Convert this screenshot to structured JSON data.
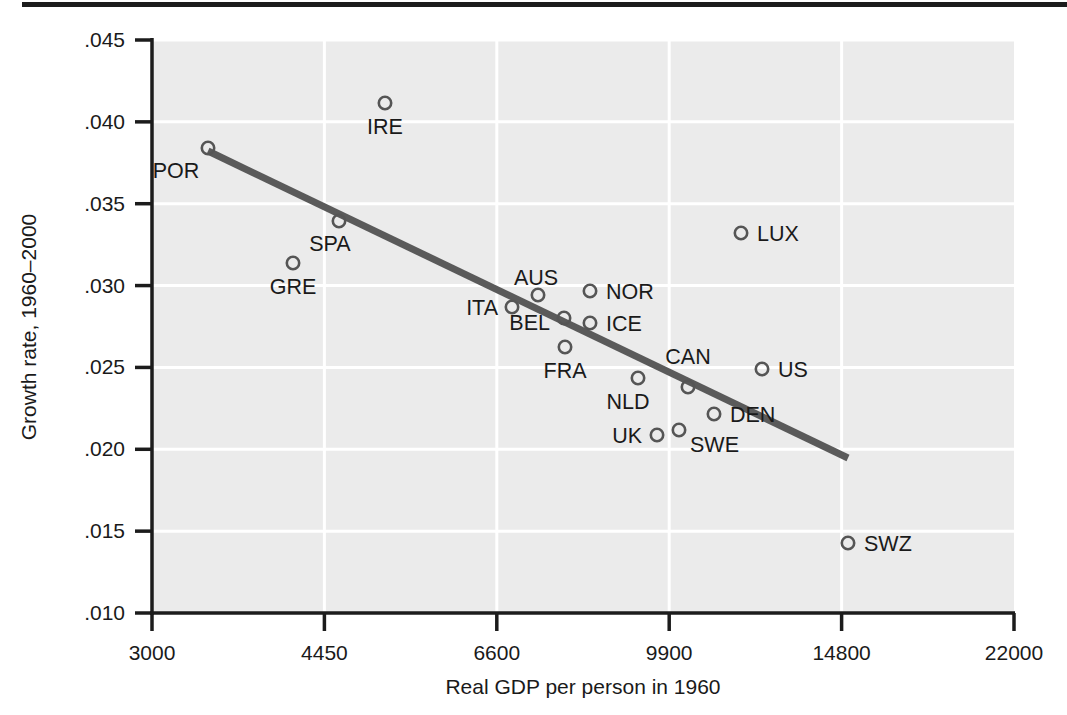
{
  "figure": {
    "background_color": "#ffffff",
    "plot_background_color": "#ebebeb",
    "gridline_color": "#ffffff",
    "axis_color": "#1c1c1c",
    "marker_color": "#555555",
    "trendline_color": "#5a5a5a",
    "top_rule_color": "#1c1c1c"
  },
  "chart_data": {
    "type": "scatter",
    "title": "",
    "xlabel": "Real GDP per person in 1960",
    "ylabel": "Growth rate, 1960–2000",
    "x_scale": "log",
    "x_ticks": [
      "3000",
      "4450",
      "6600",
      "9900",
      "14800",
      "22000"
    ],
    "x_tick_values": [
      3000,
      4450,
      6600,
      9900,
      14800,
      22000
    ],
    "y_ticks": [
      ".045",
      ".040",
      ".035",
      ".030",
      ".025",
      ".020",
      ".015",
      ".010"
    ],
    "y_tick_values": [
      0.045,
      0.04,
      0.035,
      0.03,
      0.025,
      0.02,
      0.015,
      0.01
    ],
    "xlim": [
      3000,
      22000
    ],
    "ylim": [
      0.01,
      0.045
    ],
    "grid": true,
    "legend": "none",
    "marker_style": "open-circle",
    "points": [
      {
        "label": "POR",
        "x": 3640,
        "y": 0.0385,
        "px": 208,
        "py": 148,
        "lx": 176,
        "ly": 178,
        "anchor": "middle"
      },
      {
        "label": "IRE",
        "x": 5100,
        "y": 0.041,
        "px": 385,
        "py": 103,
        "lx": 385,
        "ly": 134,
        "anchor": "middle"
      },
      {
        "label": "SPA",
        "x": 4640,
        "y": 0.034,
        "px": 339,
        "py": 221,
        "lx": 330,
        "ly": 251,
        "anchor": "middle"
      },
      {
        "label": "GRE",
        "x": 4250,
        "y": 0.0315,
        "px": 293,
        "py": 263,
        "lx": 293,
        "ly": 294,
        "anchor": "middle"
      },
      {
        "label": "LUX",
        "x": 12700,
        "y": 0.0334,
        "px": 741,
        "py": 233,
        "lx": 757,
        "ly": 241,
        "anchor": "start"
      },
      {
        "label": "ITA",
        "x": 6830,
        "y": 0.0292,
        "px": 512,
        "py": 307,
        "lx": 498,
        "ly": 315,
        "anchor": "end"
      },
      {
        "label": "AUS",
        "x": 7270,
        "y": 0.0299,
        "px": 538,
        "py": 295,
        "lx": 536,
        "ly": 285,
        "anchor": "middle"
      },
      {
        "label": "NOR",
        "x": 8250,
        "y": 0.0302,
        "px": 590,
        "py": 291,
        "lx": 606,
        "ly": 299,
        "anchor": "start"
      },
      {
        "label": "BEL",
        "x": 7740,
        "y": 0.028,
        "px": 564,
        "py": 318,
        "lx": 550,
        "ly": 330,
        "anchor": "end"
      },
      {
        "label": "ICE",
        "x": 8250,
        "y": 0.0278,
        "px": 590,
        "py": 323,
        "lx": 606,
        "ly": 331,
        "anchor": "start"
      },
      {
        "label": "FRA",
        "x": 7760,
        "y": 0.0263,
        "px": 565,
        "py": 347,
        "lx": 565,
        "ly": 378,
        "anchor": "middle"
      },
      {
        "label": "NLD",
        "x": 9310,
        "y": 0.0244,
        "px": 638,
        "py": 378,
        "lx": 628,
        "ly": 409,
        "anchor": "middle"
      },
      {
        "label": "CAN",
        "x": 10200,
        "y": 0.0239,
        "px": 688,
        "py": 387,
        "lx": 688,
        "ly": 364,
        "anchor": "middle"
      },
      {
        "label": "US",
        "x": 11800,
        "y": 0.025,
        "px": 762,
        "py": 369,
        "lx": 778,
        "ly": 377,
        "anchor": "start"
      },
      {
        "label": "DEN",
        "x": 11000,
        "y": 0.0223,
        "px": 714,
        "py": 414,
        "lx": 730,
        "ly": 422,
        "anchor": "start"
      },
      {
        "label": "SWE",
        "x": 10100,
        "y": 0.0209,
        "px": 679,
        "py": 430,
        "lx": 690,
        "ly": 452,
        "anchor": "start"
      },
      {
        "label": "UK",
        "x": 9600,
        "y": 0.0208,
        "px": 657,
        "py": 435,
        "lx": 642,
        "ly": 443,
        "anchor": "end"
      },
      {
        "label": "SWZ",
        "x": 14900,
        "y": 0.0143,
        "px": 848,
        "py": 543,
        "lx": 864,
        "ly": 551,
        "anchor": "start"
      }
    ],
    "trendline": {
      "x1": 208,
      "y1": 151,
      "x2": 848,
      "y2": 458,
      "x1_value": 3640,
      "y1_value": 0.0383,
      "x2_value": 14900,
      "y2_value": 0.0196
    }
  }
}
